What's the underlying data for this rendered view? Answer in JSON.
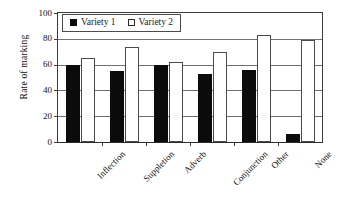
{
  "chart_data": {
    "type": "bar",
    "title": "",
    "xlabel": "",
    "ylabel": "Rate of marking",
    "ylim": [
      0,
      100
    ],
    "yticks": [
      0,
      20,
      40,
      60,
      80,
      100
    ],
    "grid": true,
    "legend_position": "top-left-inside",
    "categories": [
      "Inflection",
      "Suppletion",
      "Adverb",
      "Conjunction",
      "Other",
      "None"
    ],
    "series": [
      {
        "name": "Variety 1",
        "color": "#0b0b0b",
        "fill": "solid",
        "values": [
          60,
          55,
          60,
          53,
          56,
          6
        ]
      },
      {
        "name": "Variety 2",
        "color": "#ffffff",
        "fill": "hollow",
        "values": [
          65,
          74,
          62,
          70,
          83,
          79
        ]
      }
    ]
  },
  "axes": {
    "y_title": "Rate of marking",
    "y_ticks": [
      "0",
      "20",
      "40",
      "60",
      "80",
      "100"
    ]
  },
  "legend": {
    "items": [
      {
        "label": "Variety 1",
        "swatch": "filled-square-icon"
      },
      {
        "label": "Variety 2",
        "swatch": "hollow-square-icon"
      }
    ]
  }
}
